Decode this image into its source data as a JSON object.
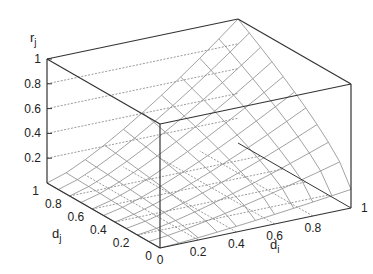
{
  "chart_data": {
    "type": "surface3d",
    "title": "",
    "xlabel": "d_i",
    "ylabel": "d_j",
    "zlabel": "r_j",
    "x_ticks": [
      "0",
      "0.2",
      "0.4",
      "0.6",
      "0.8",
      "1"
    ],
    "y_ticks": [
      "0",
      "0.2",
      "0.4",
      "0.6",
      "0.8",
      "1"
    ],
    "z_ticks": [
      "0.2",
      "0.4",
      "0.6",
      "0.8",
      "1"
    ],
    "xlim": [
      0,
      1
    ],
    "ylim": [
      0,
      1
    ],
    "zlim": [
      0,
      1
    ],
    "grid": true,
    "mesh_resolution": 10
  },
  "labels": {
    "z_axis": "r",
    "z_sub": "j",
    "y_axis": "d",
    "y_sub": "j",
    "x_axis": "d",
    "x_sub": "i"
  },
  "colors": {
    "axes": "#333333",
    "surface": "#8a8a8a",
    "grid": "#555555"
  }
}
